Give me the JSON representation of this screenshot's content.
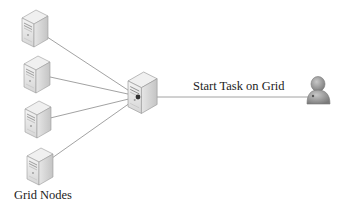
{
  "diagram": {
    "type": "network-topology",
    "labels": {
      "grid_nodes": "Grid Nodes",
      "start_task": "Start Task on Grid"
    },
    "nodes": [
      {
        "id": "grid-node-1",
        "kind": "server",
        "role": "grid node"
      },
      {
        "id": "grid-node-2",
        "kind": "server",
        "role": "grid node"
      },
      {
        "id": "grid-node-3",
        "kind": "server",
        "role": "grid node"
      },
      {
        "id": "grid-node-4",
        "kind": "server",
        "role": "grid node"
      },
      {
        "id": "central-server",
        "kind": "server",
        "role": "grid controller"
      },
      {
        "id": "user",
        "kind": "user",
        "role": "task initiator"
      }
    ],
    "edges": [
      {
        "from": "central-server",
        "to": "grid-node-1",
        "arrow": "to"
      },
      {
        "from": "central-server",
        "to": "grid-node-2",
        "arrow": "to"
      },
      {
        "from": "central-server",
        "to": "grid-node-3",
        "arrow": "to"
      },
      {
        "from": "central-server",
        "to": "grid-node-4",
        "arrow": "to"
      },
      {
        "from": "user",
        "to": "central-server",
        "arrow": "to",
        "label": "Start Task on Grid"
      }
    ],
    "colors": {
      "line": "#8a8a8a",
      "server_light": "#f2f2f2",
      "server_mid": "#d4d4d4",
      "server_dark": "#a9a9a9",
      "user": "#9a9a9a"
    }
  }
}
